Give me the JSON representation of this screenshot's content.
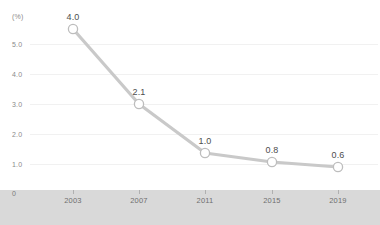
{
  "chart_data": {
    "type": "line",
    "title": "",
    "subtitle": "",
    "xlabel": "",
    "ylabel": "(%)",
    "categories": [
      "2003",
      "2007",
      "2011",
      "2015",
      "2019"
    ],
    "values": [
      4.0,
      2.1,
      1.0,
      0.8,
      0.6
    ],
    "point_labels": [
      "4.0",
      "2.1",
      "1.0",
      "0.8",
      "0.6"
    ],
    "series": [
      {
        "name": "",
        "values": [
          4.0,
          2.1,
          1.0,
          0.8,
          0.6
        ]
      }
    ],
    "y_axis": {
      "unit_label": "(%)",
      "zero_label": "0",
      "tick_labels": [
        "5.0",
        "4.0",
        "3.0",
        "2.0",
        "1.0"
      ],
      "tick_values": [
        5.0,
        4.0,
        3.0,
        2.0,
        1.0
      ],
      "ylim": [
        0,
        5.5
      ]
    },
    "x_axis": {
      "tick_labels": [
        "2003",
        "2007",
        "2011",
        "2015",
        "2019"
      ]
    },
    "grid": true,
    "legend": "none",
    "colors": {
      "line": "#c9c9c9",
      "marker_fill": "#ffffff",
      "marker_stroke": "#bdbdbd",
      "axis_band": "#d9d9d9",
      "tick_text": "#8a8a8a",
      "label_text": "#4d4d4d",
      "gridline": "#f1f1f1",
      "background": "#ffffff"
    }
  },
  "geometry": {
    "point_x": [
      73,
      139,
      205,
      272,
      338
    ],
    "point_y": [
      29,
      104,
      153,
      162,
      167
    ],
    "label_y": [
      22,
      97,
      146,
      155,
      160
    ],
    "y_tick_y": [
      44,
      74,
      104,
      134,
      164
    ]
  }
}
